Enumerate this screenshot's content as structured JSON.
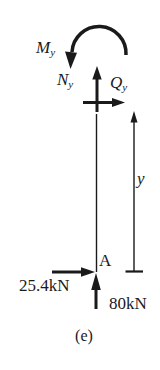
{
  "figure": {
    "caption": "(e)",
    "labels": {
      "moment": {
        "symbol": "M",
        "subscript": "y"
      },
      "normal_force": {
        "symbol": "N",
        "subscript": "y"
      },
      "shear_force": {
        "symbol": "Q",
        "subscript": "y"
      },
      "dimension": "y",
      "point": "A",
      "horizontal_load": "25.4kN",
      "vertical_load": "80kN"
    },
    "colors": {
      "ink": "#1a1a1a",
      "background": "#ffffff"
    }
  }
}
